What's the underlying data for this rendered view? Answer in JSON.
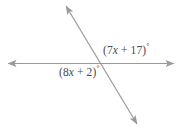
{
  "figure": {
    "background_color": "#ffffff",
    "stroke_color": "#9a9a9a",
    "text_color": "#4a4a4a",
    "stroke_width": 1.2,
    "width": 182,
    "height": 131,
    "lines": [
      {
        "name": "horizontal-line",
        "x1": 8,
        "y1": 63.5,
        "x2": 174,
        "y2": 63.5,
        "arrow_start": true,
        "arrow_end": true
      },
      {
        "name": "diagonal-line",
        "x1": 66,
        "y1": 6,
        "x2": 137,
        "y2": 124,
        "arrow_start": true,
        "arrow_end": true
      }
    ],
    "intersection": {
      "x": 99,
      "y": 63.5
    },
    "labels": [
      {
        "name": "angle-label-upper-right",
        "open_paren": "(",
        "coefficient": "7",
        "variable": "x",
        "operator": "+",
        "constant": "17",
        "close_paren": ")",
        "degree": "°",
        "full_text": "(7x + 17)°"
      },
      {
        "name": "angle-label-lower-left",
        "open_paren": "(",
        "coefficient": "8",
        "variable": "x",
        "operator": "+",
        "constant": "2",
        "close_paren": ")",
        "degree": "°",
        "full_text": "(8x + 2)°"
      }
    ]
  }
}
